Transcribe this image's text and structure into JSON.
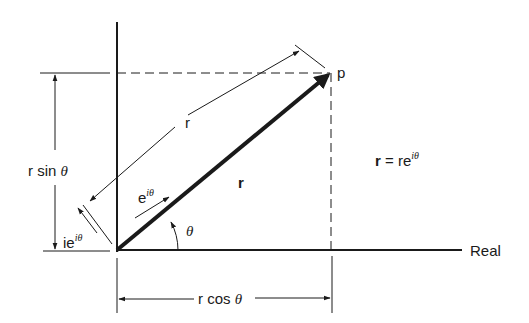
{
  "diagram": {
    "axes": {
      "real_label": "Real"
    },
    "point_label": "p",
    "vector_label": "r",
    "parallel_r_label": "r",
    "unit_vector": {
      "base": "e",
      "sup": "iθ"
    },
    "perp_unit_vector": {
      "base": "ie",
      "sup": "iθ"
    },
    "angle_label": "θ",
    "vertical_dimension": {
      "text": "r sin ",
      "theta": "θ"
    },
    "horizontal_dimension": {
      "text": "r cos ",
      "theta": "θ"
    },
    "equation": {
      "lhs": "r",
      "eq": " = re",
      "sup": "iθ"
    },
    "colors": {
      "ink": "#1a1a1a",
      "background": "#ffffff"
    }
  }
}
